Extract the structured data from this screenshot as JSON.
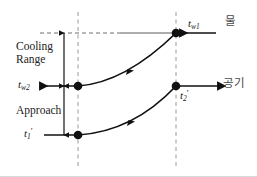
{
  "diagram": {
    "measurements": {
      "cooling_range_label": "Cooling\nRange",
      "cooling_range_line1": "Cooling",
      "cooling_range_line2": "Range",
      "approach_label": "Approach"
    },
    "temperature_labels": {
      "tw1_base": "t",
      "tw1_sub": "w1",
      "tw2_base": "t",
      "tw2_sub": "w2",
      "t1_base": "t",
      "t1_sub": "1",
      "t1_prime": "′",
      "t2_base": "t",
      "t2_sub": "2",
      "t2_prime": "′"
    },
    "stream_labels": {
      "water": "물",
      "air": "공기"
    },
    "colors": {
      "line": "#111111",
      "dashed": "#9a9a9a",
      "text": "#1a1a1a",
      "korean_text": "#4a4a4a",
      "background": "#ffffff",
      "border": "#d8d8d8"
    },
    "geometry": {
      "dash_left_x": 78,
      "dash_right_x": 176,
      "water_top_y": 33,
      "water_out_y": 86,
      "air_in_y": 135,
      "air_out_y": 86,
      "range_arrow_x": 64,
      "nodes": [
        {
          "name": "tw1-point",
          "x": 176,
          "y": 33
        },
        {
          "name": "tw2-point",
          "x": 78,
          "y": 86
        },
        {
          "name": "t1-point",
          "x": 78,
          "y": 135
        },
        {
          "name": "t2-point",
          "x": 176,
          "y": 86
        }
      ]
    }
  }
}
